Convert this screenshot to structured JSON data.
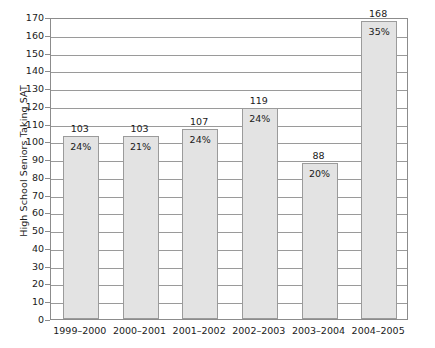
{
  "chart_data": {
    "type": "bar",
    "title": "",
    "xlabel": "",
    "ylabel": "High School Seniors Taking SAT",
    "ylim": [
      0,
      170
    ],
    "ytick_step": 10,
    "grid": true,
    "legend": "none",
    "categories": [
      "1999–2000",
      "2000–2001",
      "2001–2002",
      "2002–2003",
      "2003–2004",
      "2004–2005"
    ],
    "values": [
      103,
      103,
      107,
      119,
      88,
      168
    ],
    "value_labels": [
      "103",
      "103",
      "107",
      "119",
      "88",
      "168"
    ],
    "percent_labels": [
      "24%",
      "21%",
      "24%",
      "24%",
      "20%",
      "35%"
    ],
    "yticks": [
      "0",
      "10",
      "20",
      "30",
      "40",
      "50",
      "60",
      "70",
      "80",
      "90",
      "100",
      "110",
      "120",
      "130",
      "140",
      "150",
      "160",
      "170"
    ],
    "colors": {
      "bar_fill": "#e3e3e3",
      "bar_border": "#9b9b9b",
      "gridline": "#9a9a9a",
      "axis": "#8c8c8c",
      "text": "#1a1a1a",
      "background": "#ffffff"
    }
  }
}
